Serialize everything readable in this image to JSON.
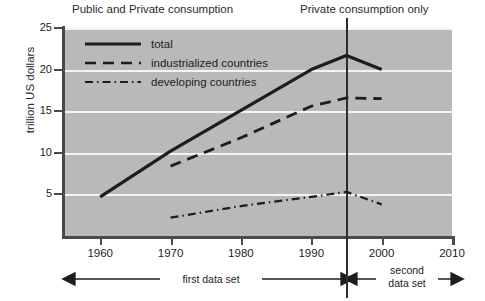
{
  "headers": {
    "left": "Public and Private consumption",
    "right": "Private consumption only"
  },
  "axes": {
    "ylabel": "trillion US dollars",
    "yticks": [
      "25",
      "20",
      "15",
      "10",
      "5"
    ],
    "xticks": [
      "1960",
      "1970",
      "1980",
      "1990",
      "2000",
      "2010"
    ]
  },
  "legend": [
    {
      "label": "total",
      "style": "solid"
    },
    {
      "label": "industrialized countries",
      "style": "dashed"
    },
    {
      "label": "developing countries",
      "style": "dash-dot"
    }
  ],
  "annotations": {
    "first": "first data set",
    "second_line1": "second",
    "second_line2": "data set",
    "divider_year": "1995"
  },
  "colors": {
    "plot_background": "#b9b9b9",
    "gridline": "#f4f4f4",
    "line": "#1d1d1d",
    "axis": "#4a4a4a",
    "page_background": "#ffffff"
  },
  "chart_data": {
    "type": "line",
    "title": "",
    "xlabel": "",
    "ylabel": "trillion US dollars",
    "xlim": [
      1955,
      2010
    ],
    "ylim": [
      0,
      25
    ],
    "grid": true,
    "legend_position": "top-left inside plot",
    "xticks": [
      1960,
      1970,
      1980,
      1990,
      2000,
      2010
    ],
    "yticks": [
      5,
      10,
      15,
      20,
      25
    ],
    "divider_x": 1995,
    "series": [
      {
        "name": "total",
        "style": "solid",
        "x": [
          1960,
          1970,
          1980,
          1990,
          1995,
          2000
        ],
        "values": [
          4.7,
          10.2,
          15.1,
          20.0,
          21.7,
          20.0
        ]
      },
      {
        "name": "industrialized countries",
        "style": "dashed",
        "x": [
          1970,
          1980,
          1990,
          1995,
          2000
        ],
        "values": [
          8.4,
          11.8,
          15.6,
          16.6,
          16.5
        ]
      },
      {
        "name": "developing countries",
        "style": "dash-dot",
        "x": [
          1970,
          1980,
          1990,
          1995,
          2000
        ],
        "values": [
          2.2,
          3.6,
          4.7,
          5.3,
          3.8
        ]
      }
    ]
  }
}
